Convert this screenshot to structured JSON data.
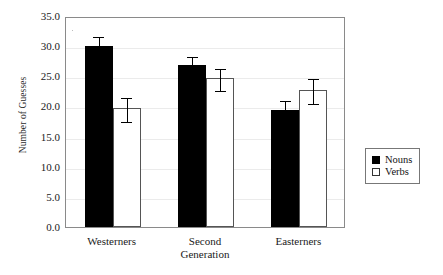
{
  "chart_data": {
    "type": "bar",
    "title": "",
    "xlabel": "",
    "ylabel": "Number of Guesses",
    "categories": [
      "Westerners",
      "Second\nGeneration",
      "Easterners"
    ],
    "series": [
      {
        "name": "Nouns",
        "values": [
          30.0,
          26.8,
          19.4
        ],
        "errors": [
          1.8,
          1.7,
          1.9
        ],
        "color": "#000000"
      },
      {
        "name": "Verbs",
        "values": [
          19.8,
          24.7,
          22.8
        ],
        "errors": [
          2.0,
          1.8,
          2.0
        ],
        "color": "#ffffff"
      }
    ],
    "ylim": [
      0.0,
      35.0
    ],
    "yticks": [
      "0.0",
      "5.0",
      "10.0",
      "15.0",
      "20.0",
      "25.0",
      "30.0",
      "35.0"
    ],
    "ytick_values": [
      0.0,
      5.0,
      10.0,
      15.0,
      20.0,
      25.0,
      30.0,
      35.0
    ],
    "grid": true,
    "legend_position": "right",
    "error_bar_style": "capped"
  },
  "legend": {
    "entries": [
      {
        "label": "Nouns",
        "swatch": "filled-black-square"
      },
      {
        "label": "Verbs",
        "swatch": "open-white-square"
      }
    ]
  }
}
